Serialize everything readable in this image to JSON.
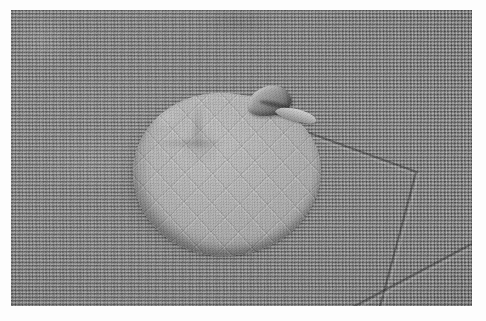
{
  "image": {
    "domain": "Natural-Image",
    "kind": "photograph",
    "color_mode": "grayscale",
    "width": 486,
    "height": 321,
    "caption": "Grayscale close-up photograph of a round pale quilted fabric pad resting on a coarse woven grey cloth",
    "border": {
      "present": true,
      "color": "#fdfdfd",
      "left": 11,
      "top": 10,
      "right": 14,
      "bottom": 15
    },
    "plate": {
      "width": 461,
      "height": 296,
      "background_color": "#8a8a8a"
    }
  },
  "scene": {
    "background": {
      "label": "woven grey cloth",
      "description": "fine basket-weave textile filling the whole frame",
      "base_color": "#8a8a8a",
      "highlight_color": "#9a9a9a",
      "shadow_color": "#6e6e6e",
      "weave_pitch_px": 3.4
    },
    "subject": {
      "label": "round quilted fabric pad",
      "shape": "irregular circle / disc",
      "surface_pattern": "diagonal crosshatch diamond quilting",
      "fill_color": "#b2b2b2",
      "highlight_color": "#c6c6c6",
      "edge_shadow_color": "#3c3c3c",
      "bounds": {
        "x": 122,
        "y": 83,
        "width": 188,
        "height": 164
      },
      "center": {
        "x": 216,
        "y": 165
      },
      "features": [
        {
          "name": "folded tab",
          "position": "top-right of disc",
          "color": "#787878"
        },
        {
          "name": "turned lip",
          "position": "right of folded tab",
          "color": "#c0c0c0"
        },
        {
          "name": "cast shadow",
          "position": "left and lower edge of disc",
          "color": "#3a3a3a"
        }
      ]
    },
    "fold_lines": [
      {
        "name": "upper-right fold",
        "from": {
          "x": 307,
          "y": 131
        },
        "to": {
          "x": 416,
          "y": 172
        },
        "tone": "#4a4a4a"
      },
      {
        "name": "vertical right fold",
        "from": {
          "x": 416,
          "y": 172
        },
        "to": {
          "x": 381,
          "y": 305
        },
        "tone": "#4a4a4a"
      },
      {
        "name": "lower diagonal fold",
        "from": {
          "x": 472,
          "y": 243
        },
        "to": {
          "x": 352,
          "y": 306
        },
        "tone": "#4a4a4a"
      }
    ]
  }
}
